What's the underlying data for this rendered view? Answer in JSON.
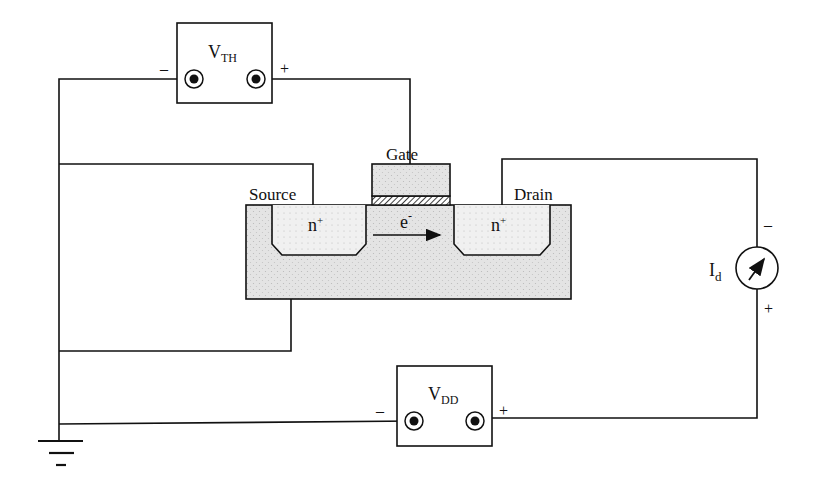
{
  "diagram": {
    "type": "nmos-threshold-measurement-circuit",
    "colors": {
      "line": "#111111",
      "substrate": "#e2e2e2",
      "well": "#ececec",
      "background": "#ffffff"
    },
    "labels": {
      "vth_main": "V",
      "vth_sub": "TH",
      "vdd_main": "V",
      "vdd_sub": "DD",
      "gate": "Gate",
      "source": "Source",
      "drain": "Drain",
      "n_plus_source": "n",
      "n_plus_drain": "n",
      "n_plus_sup": "+",
      "electron": "e",
      "electron_sup": "-",
      "meter_main": "I",
      "meter_sub": "d"
    },
    "polarity": {
      "vth_minus": "–",
      "vth_plus": "+",
      "vdd_minus": "–",
      "vdd_plus": "+",
      "meter_top": "–",
      "meter_bottom": "+"
    },
    "components": [
      {
        "id": "vth-source",
        "kind": "voltage-source",
        "label": "VTH"
      },
      {
        "id": "vdd-source",
        "kind": "voltage-source",
        "label": "VDD"
      },
      {
        "id": "ammeter",
        "kind": "current-meter",
        "label": "Id"
      },
      {
        "id": "mosfet",
        "kind": "n-channel-mosfet",
        "terminals": [
          "Gate",
          "Source",
          "Drain",
          "Body"
        ]
      },
      {
        "id": "ground",
        "kind": "ground"
      }
    ]
  }
}
